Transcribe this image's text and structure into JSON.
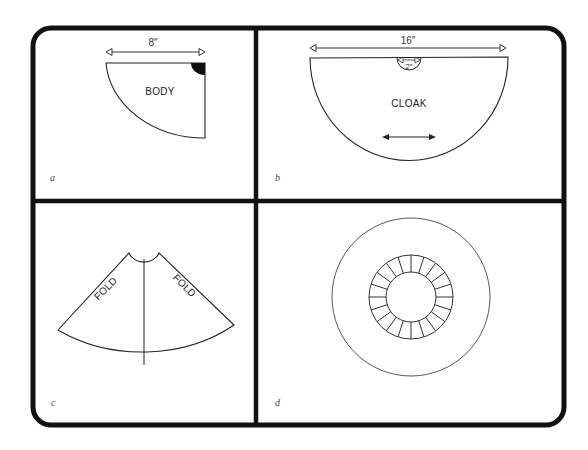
{
  "figure": {
    "frame_color": "#111111",
    "line_color": "#222222",
    "panels": [
      {
        "id": "a",
        "letter": "a",
        "piece_label": "BODY",
        "dimension_label": "8″",
        "shape": "quarter-circle pattern piece with black neck corner"
      },
      {
        "id": "b",
        "letter": "b",
        "piece_label": "CLOAK",
        "dimension_label": "16″",
        "neck_dimension_label": "2″",
        "shape": "half-circle pattern piece with neck cut-out and grain arrow"
      },
      {
        "id": "c",
        "letter": "c",
        "fold_labels": [
          "FOLD",
          "FOLD"
        ],
        "shape": "folded cloak cone with center seam"
      },
      {
        "id": "d",
        "letter": "d",
        "shape": "full circle with segmented collar ring",
        "ring_segments": 20
      }
    ]
  }
}
